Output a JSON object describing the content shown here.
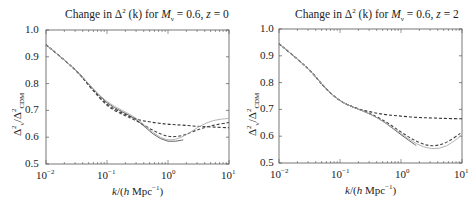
{
  "chart_data": [
    {
      "type": "line",
      "title": "Change in Δ²(k) for Mν = 0.6, z = 0",
      "title_parts": {
        "prefix": "Change in Δ",
        "sup": "2",
        "mid": " (k) for M",
        "sub": "ν",
        "suffix": " = 0.6, z = 0"
      },
      "xlabel": "k/(h Mpc⁻¹)",
      "ylabel": "Δ²ν/Δ²CDM",
      "xscale": "log",
      "xlim": [
        0.01,
        10
      ],
      "ylim": [
        0.5,
        1.0
      ],
      "xticks": [
        "10⁻²",
        "10⁻¹",
        "10⁰",
        "10¹"
      ],
      "yticks": [
        "0.5",
        "0.6",
        "0.7",
        "0.8",
        "0.9",
        "1.0"
      ],
      "grid": false,
      "legend": "none",
      "log10_k": [
        -2,
        -1.5,
        -1.25,
        -1,
        -0.75,
        -0.5,
        -0.25,
        0,
        0.25,
        0.5,
        0.75,
        1
      ],
      "series": [
        {
          "name": "dashed (linear)",
          "style": "dashed",
          "color": "#333333",
          "values": [
            0.945,
            0.85,
            0.78,
            0.72,
            0.69,
            0.665,
            0.655,
            0.648,
            0.645,
            0.64,
            0.638,
            0.635
          ]
        },
        {
          "name": "dashed (nonlinear)",
          "style": "dashed",
          "color": "#444444",
          "values": [
            0.945,
            0.85,
            0.78,
            0.715,
            0.685,
            0.66,
            0.625,
            0.6,
            0.605,
            0.63,
            0.645,
            0.655
          ]
        },
        {
          "name": "solid dark",
          "style": "solid",
          "color": "#555555",
          "values": [
            0.945,
            0.85,
            0.785,
            0.725,
            0.695,
            0.665,
            0.61,
            0.58,
            0.59,
            null,
            null,
            null
          ]
        },
        {
          "name": "solid light",
          "style": "solid",
          "color": "#aaaaaa",
          "values": [
            0.945,
            0.85,
            0.785,
            0.73,
            0.7,
            0.67,
            0.615,
            0.585,
            0.6,
            0.64,
            0.665,
            0.67
          ]
        }
      ]
    },
    {
      "type": "line",
      "title": "Change in Δ²(k) for Mν = 0.6, z = 2",
      "title_parts": {
        "prefix": "Change in Δ",
        "sup": "2",
        "mid": " (k) for M",
        "sub": "ν",
        "suffix": " = 0.6, z = 2"
      },
      "xlabel": "k/(h Mpc⁻¹)",
      "ylabel": "Δ²ν/Δ²CDM",
      "xscale": "log",
      "xlim": [
        0.01,
        10
      ],
      "ylim": [
        0.5,
        1.0
      ],
      "xticks": [
        "10⁻²",
        "10⁻¹",
        "10⁰",
        "10¹"
      ],
      "yticks": [
        "0.5",
        "0.6",
        "0.7",
        "0.8",
        "0.9",
        "1.0"
      ],
      "grid": false,
      "legend": "none",
      "log10_k": [
        -2,
        -1.5,
        -1.25,
        -1,
        -0.75,
        -0.5,
        -0.25,
        0,
        0.25,
        0.5,
        0.75,
        1
      ],
      "series": [
        {
          "name": "dashed (linear)",
          "style": "dashed",
          "color": "#333333",
          "values": [
            0.945,
            0.85,
            0.78,
            0.73,
            0.705,
            0.69,
            0.68,
            0.675,
            0.67,
            0.668,
            0.666,
            0.665
          ]
        },
        {
          "name": "dashed (nonlinear)",
          "style": "dashed",
          "color": "#444444",
          "values": [
            0.945,
            0.85,
            0.78,
            0.73,
            0.705,
            0.685,
            0.655,
            0.615,
            0.58,
            0.56,
            0.575,
            0.615
          ]
        },
        {
          "name": "solid dark",
          "style": "solid",
          "color": "#555555",
          "values": [
            0.945,
            0.85,
            0.78,
            0.73,
            0.705,
            0.683,
            0.65,
            0.605,
            0.565,
            null,
            null,
            null
          ]
        },
        {
          "name": "solid light",
          "style": "solid",
          "color": "#aaaaaa",
          "values": [
            0.945,
            0.85,
            0.78,
            0.73,
            0.705,
            0.683,
            0.65,
            0.61,
            0.57,
            0.55,
            0.56,
            0.605
          ]
        }
      ]
    }
  ],
  "panels": [
    {
      "title_prefix": "Change in Δ",
      "title_sup": "2",
      "title_mid": " (k) for ",
      "title_M": "M",
      "title_sub": "ν",
      "title_suffix": " = 0.6, ",
      "title_z": "z",
      "title_zval": " = 0",
      "x_ticks": [
        {
          "base": "10",
          "exp": "−2"
        },
        {
          "base": "10",
          "exp": "−1"
        },
        {
          "base": "10",
          "exp": "0"
        },
        {
          "base": "10",
          "exp": "1"
        }
      ],
      "y_ticks": [
        "1.0",
        "0.9",
        "0.8",
        "0.7",
        "0.6",
        "0.5"
      ],
      "xlabel_k": "k",
      "xlabel_mid": "/(",
      "xlabel_h": "h",
      "xlabel_rest": " Mpc",
      "xlabel_exp": "−1",
      "xlabel_close": ")",
      "ylabel_main": "Δ",
      "ylabel_sup1": "2",
      "ylabel_sub1": "ν",
      "ylabel_slash": "/Δ",
      "ylabel_sup2": "2",
      "ylabel_sub2": "CDM"
    },
    {
      "title_prefix": "Change in Δ",
      "title_sup": "2",
      "title_mid": " (k) for ",
      "title_M": "M",
      "title_sub": "ν",
      "title_suffix": " = 0.6, ",
      "title_z": "z",
      "title_zval": " = 2",
      "x_ticks": [
        {
          "base": "10",
          "exp": "−2"
        },
        {
          "base": "10",
          "exp": "−1"
        },
        {
          "base": "10",
          "exp": "0"
        },
        {
          "base": "10",
          "exp": "1"
        }
      ],
      "y_ticks": [
        "1.0",
        "0.9",
        "0.8",
        "0.7",
        "0.6",
        "0.5"
      ],
      "xlabel_k": "k",
      "xlabel_mid": "/(",
      "xlabel_h": "h",
      "xlabel_rest": " Mpc",
      "xlabel_exp": "−1",
      "xlabel_close": ")",
      "ylabel_main": "Δ",
      "ylabel_sup1": "2",
      "ylabel_sub1": "ν",
      "ylabel_slash": "/Δ",
      "ylabel_sup2": "2",
      "ylabel_sub2": "CDM"
    }
  ]
}
